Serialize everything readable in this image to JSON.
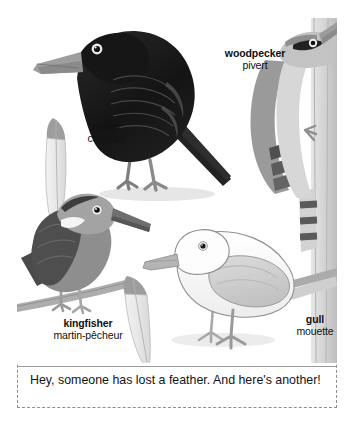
{
  "page": {
    "type": "illustrated-bird-plate",
    "background_color": "#ffffff",
    "frame_border_color": "#8d8d8d",
    "divider_color": "#9a9a9a"
  },
  "labels": [
    {
      "id": "raven",
      "en": "raven",
      "fr": "corbeau"
    },
    {
      "id": "woodpecker",
      "en": "woodpecker",
      "fr": "pivert"
    },
    {
      "id": "kingfisher",
      "en": "kingfisher",
      "fr": "martin-pêcheur"
    },
    {
      "id": "gull",
      "en": "gull",
      "fr": "mouette"
    }
  ],
  "caption": {
    "text": "Hey, someone has lost a feather. And here's another!"
  },
  "artwork": {
    "palette": {
      "ink": "#4a4a4a",
      "raven_black": "#1a1a1a",
      "raven_dark": "#2e2e2e",
      "raven_mid": "#3f3f3f",
      "beak_grey": "#9b9b9b",
      "leg_grey": "#8a8a8a",
      "mid_grey": "#8e8e8e",
      "dark_grey": "#5d5d5d",
      "light_grey": "#c9c9c9",
      "pale_grey": "#e4e4e4",
      "white": "#fbfbfb",
      "shadow": "#dcdcdc",
      "branch": "#a3a3a3",
      "trunk": "#cfcfcf"
    },
    "subjects": [
      {
        "name": "raven-bird",
        "description": "large black perching bird facing left"
      },
      {
        "name": "woodpecker-bird",
        "description": "woodpecker clinging vertically to a tree trunk, barred tail"
      },
      {
        "name": "kingfisher-bird",
        "description": "kingfisher perched on a diagonal branch, long dark bill"
      },
      {
        "name": "gull-bird",
        "description": "white gull standing, pale grey wings"
      },
      {
        "name": "feather-left",
        "description": "pale feather with dark grey tip"
      },
      {
        "name": "feather-center",
        "description": "pale feather with dark grey tip"
      }
    ]
  }
}
